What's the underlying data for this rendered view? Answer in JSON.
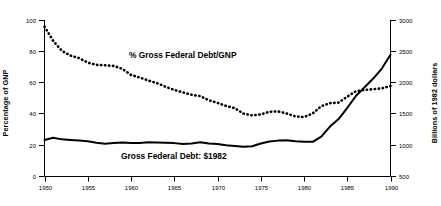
{
  "chart_data": {
    "type": "line",
    "title": "",
    "xlabel": "",
    "ylabel": "Percentage of GNP",
    "ylabel_right": "Billions of 1982 dollars",
    "grid": false,
    "legend_position": "inline-annotations",
    "xlim": [
      1950,
      1990
    ],
    "ylim": [
      0,
      100
    ],
    "ylim_right": [
      500,
      3000
    ],
    "xticks": [
      1950,
      1955,
      1960,
      1965,
      1970,
      1975,
      1980,
      1985,
      1990
    ],
    "xtick_labels": [
      "1950",
      "1955",
      "1960",
      "1965",
      "1970",
      "1975",
      "1980",
      "1985",
      "1990"
    ],
    "yticks_left": [
      0,
      20,
      40,
      60,
      80,
      100
    ],
    "ytick_labels_left": [
      "0",
      "20",
      "40",
      "60",
      "80",
      "100"
    ],
    "yticks_right": [
      500,
      1000,
      1500,
      2000,
      2500,
      3000
    ],
    "ytick_labels_right": [
      "500",
      "1000",
      "1500",
      "2000",
      "2500",
      "3000"
    ],
    "annotations": [
      {
        "text": "% Gross Federal Debt/GNP",
        "x": 1961.5,
        "y": 68,
        "series": "pct-gross-federal-debt-gnp"
      },
      {
        "text": "Gross Federal Debt: $1982",
        "x": 1960.5,
        "y": 13,
        "series": "gross-federal-debt-1982-dollars"
      }
    ],
    "x": [
      1950,
      1951,
      1952,
      1953,
      1954,
      1955,
      1956,
      1957,
      1958,
      1959,
      1960,
      1961,
      1962,
      1963,
      1964,
      1965,
      1966,
      1967,
      1968,
      1969,
      1970,
      1971,
      1972,
      1973,
      1974,
      1975,
      1976,
      1977,
      1978,
      1979,
      1980,
      1981,
      1982,
      1983,
      1984,
      1985,
      1986,
      1987,
      1988,
      1989,
      1990
    ],
    "series": [
      {
        "name": "% Gross Federal Debt/GNP",
        "axis": "left",
        "units": "percent of GNP",
        "style": "dotted",
        "color": "#000000",
        "values": [
          96.1,
          87.0,
          80.6,
          77.5,
          75.9,
          73.0,
          71.6,
          71.3,
          70.9,
          69.0,
          65.1,
          63.5,
          61.5,
          59.9,
          57.5,
          55.5,
          53.9,
          52.4,
          51.5,
          48.9,
          47.2,
          45.2,
          43.8,
          40.3,
          39.2,
          39.8,
          41.5,
          41.7,
          40.4,
          38.5,
          38.1,
          40.4,
          45.1,
          47.0,
          47.4,
          51.2,
          54.7,
          55.5,
          56.0,
          56.5,
          58.0
        ]
      },
      {
        "name": "Gross Federal Debt: $1982 dollars",
        "axis": "right",
        "units": "billions of 1982 dollars",
        "style": "solid",
        "color": "#000000",
        "values": [
          1085,
          1120,
          1095,
          1085,
          1075,
          1065,
          1040,
          1025,
          1035,
          1045,
          1035,
          1035,
          1048,
          1045,
          1040,
          1035,
          1020,
          1030,
          1050,
          1030,
          1020,
          1000,
          988,
          975,
          985,
          1030,
          1060,
          1075,
          1080,
          1065,
          1055,
          1055,
          1140,
          1300,
          1420,
          1600,
          1790,
          1930,
          2070,
          2230,
          2450
        ]
      }
    ]
  },
  "axes": {
    "left": {
      "title": "Percentage of GNP"
    },
    "right": {
      "title": "Billions of 1982 dollars"
    }
  },
  "labels": {
    "pct_series": "% Gross Federal Debt/GNP",
    "dollar_series": "Gross Federal Debt: $1982"
  }
}
